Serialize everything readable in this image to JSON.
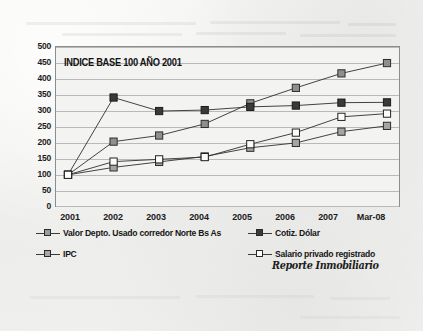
{
  "document": {
    "type": "scanned-chart-figure",
    "watermark": "Reporte Inmobiliario"
  },
  "chart_data": {
    "type": "line",
    "title": "INDICE BASE 100 AÑO 2001",
    "xlabel": "",
    "ylabel": "",
    "ylim": [
      0,
      500
    ],
    "ytick_step": 50,
    "yticks": [
      0,
      50,
      100,
      150,
      200,
      250,
      300,
      350,
      400,
      450,
      500
    ],
    "grid": true,
    "legend_position": "bottom",
    "categories": [
      "2001",
      "2002",
      "2003",
      "2004",
      "2005",
      "2006",
      "2007",
      "Mar-08"
    ],
    "series": [
      {
        "name": "Valor Depto. Usado corredor Norte Bs As",
        "color": "#8a8a8a",
        "marker": "square-gray",
        "values": [
          100,
          203,
          222,
          258,
          322,
          370,
          415,
          447
        ]
      },
      {
        "name": "Cotiz. Dólar",
        "color": "#3a3a3a",
        "marker": "square-dark",
        "values": [
          100,
          340,
          298,
          301,
          311,
          315,
          324,
          325
        ]
      },
      {
        "name": "IPC",
        "color": "#9a9a9a",
        "marker": "square-lightgray",
        "values": [
          100,
          123,
          140,
          157,
          184,
          199,
          234,
          252
        ]
      },
      {
        "name": "Salario privado registrado",
        "color": "#ffffff",
        "marker": "square-white",
        "values": [
          100,
          141,
          148,
          155,
          195,
          231,
          280,
          290
        ]
      }
    ]
  },
  "legend": [
    {
      "label": "Valor Depto. Usado corredor Norte Bs As",
      "swatch": "square-gray"
    },
    {
      "label": "Cotiz. Dólar",
      "swatch": "square-dark"
    },
    {
      "label": "IPC",
      "swatch": "square-lightgray"
    },
    {
      "label": "Salario privado registrado",
      "swatch": "square-white"
    }
  ],
  "colors": {
    "plot_background": "#f3f3f1",
    "grid": "#b9b9b9",
    "axis": "#8d8d8d",
    "text": "#1b1b1b",
    "series_valor_depto": "#8a8a8a",
    "series_dolar": "#3a3a3a",
    "series_ipc": "#9a9a9a",
    "series_salario": "#ffffff"
  }
}
